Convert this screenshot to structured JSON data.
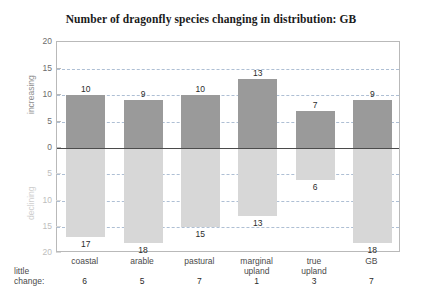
{
  "chart_data": {
    "type": "bar",
    "title": "Number of dragonfly species changing in distribution: GB",
    "xlabel": "",
    "ylabel": "",
    "categories": [
      "coastal",
      "arable",
      "pastural",
      "marginal upland",
      "true upland",
      "GB"
    ],
    "series": [
      {
        "name": "increasing",
        "values": [
          10,
          9,
          10,
          13,
          7,
          9
        ]
      },
      {
        "name": "declining",
        "values": [
          17,
          18,
          15,
          13,
          6,
          18
        ]
      }
    ],
    "little_change": {
      "label_line1": "little",
      "label_line2": "change:",
      "values": [
        6,
        5,
        7,
        1,
        3,
        7
      ]
    },
    "axis": {
      "increasing_label": "increasing",
      "declining_label": "declining",
      "ticks_increasing": [
        20,
        15,
        10,
        5,
        0
      ],
      "ticks_declining": [
        5,
        10,
        15,
        20
      ],
      "ylim_increasing": 20,
      "ylim_declining": 20,
      "grid": true,
      "gridlines_increasing": [
        15,
        10,
        5
      ],
      "gridlines_declining": [
        5,
        10,
        15
      ]
    },
    "colors": {
      "increasing_bar": "#9a9a9a",
      "declining_bar": "#d7d7d7",
      "gridline": "#aebfd4",
      "zero_line": "#4b4b4b",
      "frame": "#b9b9b9",
      "background": "#ffffff",
      "title_text": "#1a1a1a"
    },
    "legend": {
      "position": "none"
    }
  }
}
